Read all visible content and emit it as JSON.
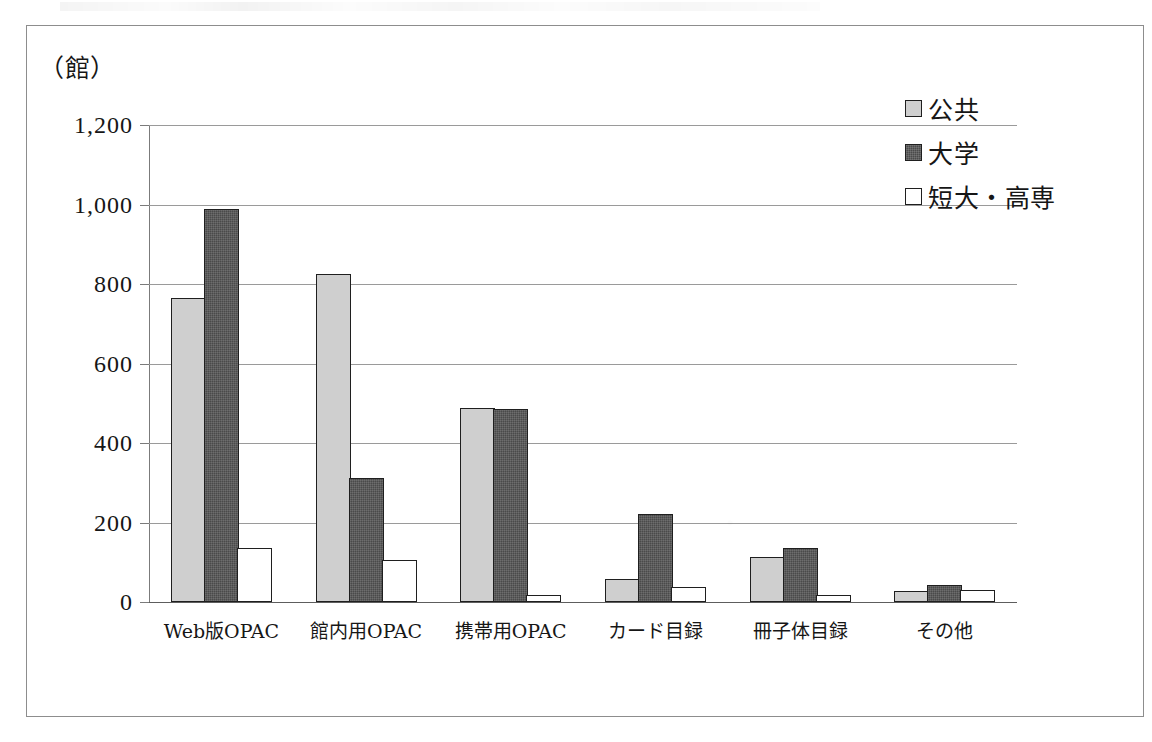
{
  "figure": {
    "unit_label": "（館）",
    "frame": true
  },
  "legend": {
    "position": "top-right",
    "items": [
      {
        "label": "公共",
        "swatch": "s-public",
        "color": "#cfcfcf"
      },
      {
        "label": "大学",
        "swatch": "s-university",
        "color": "#4a4a4a"
      },
      {
        "label": "短大・高専",
        "swatch": "s-junior",
        "color": "#ffffff"
      }
    ]
  },
  "axis": {
    "y_ticks": [
      "1,200",
      "1,000",
      "800",
      "600",
      "400",
      "200",
      "0"
    ],
    "y_values": [
      1200,
      1000,
      800,
      600,
      400,
      200,
      0
    ]
  },
  "chart_data": {
    "type": "bar",
    "title": "",
    "subtitle": "",
    "xlabel": "",
    "ylabel": "（館）",
    "ylim": [
      0,
      1200
    ],
    "ytick_step": 200,
    "grid": true,
    "legend_position": "top-right",
    "categories": [
      "Web版OPAC",
      "館内用OPAC",
      "携帯用OPAC",
      "カード目録",
      "冊子体目録",
      "その他"
    ],
    "series": [
      {
        "name": "公共",
        "color": "#cfcfcf",
        "values": [
          765,
          825,
          488,
          57,
          113,
          28
        ]
      },
      {
        "name": "大学",
        "color": "#4a4a4a",
        "values": [
          988,
          313,
          486,
          222,
          136,
          43
        ]
      },
      {
        "name": "短大・高専",
        "color": "#ffffff",
        "values": [
          135,
          105,
          17,
          39,
          18,
          29
        ]
      }
    ]
  }
}
